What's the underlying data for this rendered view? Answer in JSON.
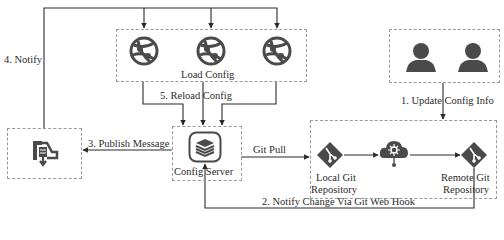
{
  "diagram": {
    "type": "architecture-flow",
    "nodes": {
      "clients": {
        "label": "Load Config",
        "icon": "globe-app-icon",
        "count": 3
      },
      "users": {
        "icon": "user-icon",
        "count": 2
      },
      "message_bus": {
        "icon": "message-queue-icon"
      },
      "config_server": {
        "label": "Config Server",
        "icon": "database-stack-icon"
      },
      "git_group": {
        "local_repo": {
          "label_line1": "Local Git",
          "label_line2": "Repository",
          "icon": "git-icon"
        },
        "hub": {
          "icon": "cloud-network-icon"
        },
        "remote_repo": {
          "label_line1": "Remote Git",
          "label_line2": "Repository",
          "icon": "git-icon"
        }
      }
    },
    "edges": {
      "update": "1. Update Config Info",
      "webhook": "2. Notify Change Via Git Web Hook",
      "publish": "3. Publish Message",
      "notify": "4. Notify",
      "reload": "5. Reload Config",
      "pull": "Git Pull"
    },
    "colors": {
      "line": "#2a2a2a",
      "icon": "#4a4a4a",
      "dash": "#9a9a9a"
    }
  }
}
